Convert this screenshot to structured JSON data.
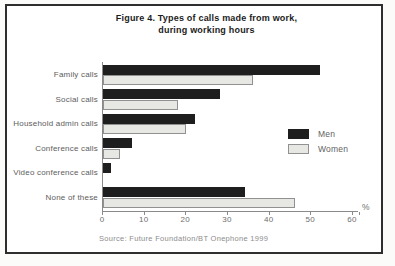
{
  "title": {
    "line1": "Figure 4. Types of calls made from work,",
    "line2": "during working hours"
  },
  "source": "Source: Future Foundation/BT Onephone 1999",
  "chart_data": {
    "type": "bar",
    "orientation": "horizontal",
    "title": "Figure 4. Types of calls made from work, during working hours",
    "categories": [
      "Family calls",
      "Social calls",
      "Household admin calls",
      "Conference calls",
      "Video conference calls",
      "None of these"
    ],
    "series": [
      {
        "name": "Men",
        "values": [
          52,
          28,
          22,
          7,
          2,
          34
        ]
      },
      {
        "name": "Women",
        "values": [
          36,
          18,
          20,
          4,
          0,
          46
        ]
      }
    ],
    "xlim": [
      0,
      60
    ],
    "xticks": [
      0,
      10,
      20,
      30,
      40,
      50,
      60
    ],
    "x_unit": "%",
    "legend_position": "middle-right",
    "grid": false
  },
  "colors": {
    "men_bar": "#1e1e1e",
    "women_bar_fill": "#e7e7e4",
    "women_bar_border": "#919191",
    "axis": "#8a8a8a",
    "text_labels": "#5d5d5d",
    "title_text": "#1b1b1b",
    "frame_border": "#2e2e2e"
  }
}
